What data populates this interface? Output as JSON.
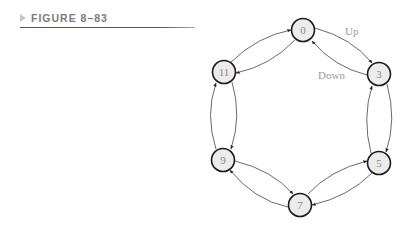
{
  "figure": {
    "label": "FIGURE 8–83",
    "marker_icon": "triangle-right-icon"
  },
  "diagram": {
    "type": "state-transition-cycle",
    "nodes": [
      {
        "id": "0",
        "label": "0",
        "x": 303,
        "y": 30
      },
      {
        "id": "3",
        "label": "3",
        "x": 379,
        "y": 74
      },
      {
        "id": "5",
        "label": "5",
        "x": 379,
        "y": 163
      },
      {
        "id": "7",
        "label": "7",
        "x": 300,
        "y": 205
      },
      {
        "id": "9",
        "label": "9",
        "x": 223,
        "y": 160
      },
      {
        "id": "11",
        "label": "11",
        "x": 224,
        "y": 72
      }
    ],
    "edges": [
      {
        "from": "0",
        "to": "3",
        "direction": "up"
      },
      {
        "from": "3",
        "to": "5",
        "direction": "up"
      },
      {
        "from": "5",
        "to": "7",
        "direction": "up"
      },
      {
        "from": "7",
        "to": "9",
        "direction": "up"
      },
      {
        "from": "9",
        "to": "11",
        "direction": "up"
      },
      {
        "from": "11",
        "to": "0",
        "direction": "up"
      },
      {
        "from": "3",
        "to": "0",
        "direction": "down"
      },
      {
        "from": "0",
        "to": "11",
        "direction": "down"
      },
      {
        "from": "11",
        "to": "9",
        "direction": "down"
      },
      {
        "from": "9",
        "to": "7",
        "direction": "down"
      },
      {
        "from": "7",
        "to": "5",
        "direction": "down"
      },
      {
        "from": "5",
        "to": "3",
        "direction": "down"
      }
    ],
    "labels": {
      "up": "Up",
      "down": "Down"
    },
    "colors": {
      "node_fill": "#ececec",
      "node_stroke": "#1a1a1a",
      "label_text": "#9a9a9a",
      "edge": "#444444"
    }
  }
}
